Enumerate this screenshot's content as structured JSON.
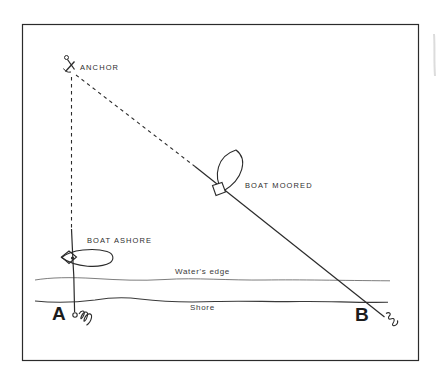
{
  "figure": {
    "type": "line-art-diagram",
    "description_labels": {
      "anchor": "ANCHOR",
      "boat_moored": "BOAT MOORED",
      "boat_ashore": "BOAT ASHORE",
      "waters_edge": "Water's edge",
      "shore": "Shore",
      "point_a": "A",
      "point_b": "B"
    },
    "colors": {
      "ink": "#2b2b2b",
      "background": "#ffffff",
      "water_line": "#6e6e6e",
      "shore_line": "#3a3a3a",
      "artifact_gray": "#c9c9c9"
    },
    "icons": {
      "anchor": "anchor-icon",
      "rope_coil_a": "rope-coil-icon",
      "rope_end_b": "rope-end-icon"
    }
  }
}
